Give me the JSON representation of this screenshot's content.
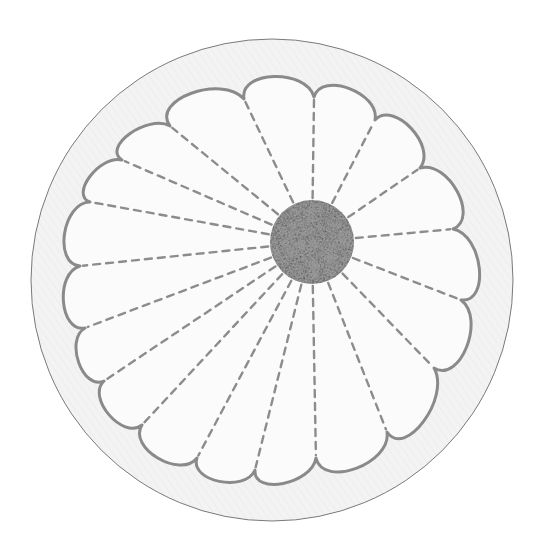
{
  "image": {
    "subject": "embroidered daisy / chrysanthemum on circular fabric",
    "width": 543,
    "height": 539
  },
  "colors": {
    "background": "#ffffff",
    "fabric": "#f3f3f3",
    "fabric_twill": "#e2e2e2",
    "hoop_edge": "#7a7a7a",
    "outline_stitch": "#8a8a8a",
    "dash_stitch": "#8c8c8c",
    "center_fill": "#b9b9b9",
    "center_knot": "#9a9a9a"
  },
  "fabric_circle": {
    "cx": 272,
    "cy": 280,
    "r": 241
  },
  "center_disc": {
    "cx": 312,
    "cy": 242,
    "r": 42
  },
  "petal_junctions": [
    [
      244,
      99
    ],
    [
      314,
      97
    ],
    [
      375,
      120
    ],
    [
      420,
      168
    ],
    [
      453,
      229
    ],
    [
      461,
      300
    ],
    [
      434,
      368
    ],
    [
      387,
      432
    ],
    [
      316,
      458
    ],
    [
      255,
      470
    ],
    [
      197,
      458
    ],
    [
      142,
      425
    ],
    [
      104,
      381
    ],
    [
      85,
      328
    ],
    [
      80,
      266
    ],
    [
      90,
      202
    ],
    [
      122,
      160
    ],
    [
      170,
      126
    ]
  ],
  "petal_count": 18
}
